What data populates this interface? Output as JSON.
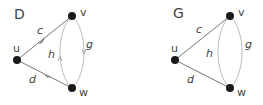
{
  "colors": {
    "node": "#1a1a1a",
    "straight_edge": "#777777",
    "curved_edge": "#bbbbbb",
    "text": "#444444"
  },
  "graphs": [
    {
      "name": "D",
      "directed": true,
      "title": "D",
      "nodes": [
        {
          "id": "u",
          "label": "u"
        },
        {
          "id": "v",
          "label": "v"
        },
        {
          "id": "w",
          "label": "w"
        }
      ],
      "edges": [
        {
          "label": "c",
          "from": "u",
          "to": "v"
        },
        {
          "label": "d",
          "from": "w",
          "to": "u"
        },
        {
          "label": "g",
          "from": "v",
          "to": "w"
        },
        {
          "label": "h",
          "from": "w",
          "to": "v"
        }
      ]
    },
    {
      "name": "G",
      "directed": false,
      "title": "G",
      "nodes": [
        {
          "id": "u",
          "label": "u"
        },
        {
          "id": "v",
          "label": "v"
        },
        {
          "id": "w",
          "label": "w"
        }
      ],
      "edges": [
        {
          "label": "c",
          "ends": [
            "u",
            "v"
          ]
        },
        {
          "label": "d",
          "ends": [
            "u",
            "w"
          ]
        },
        {
          "label": "g",
          "ends": [
            "v",
            "w"
          ]
        },
        {
          "label": "h",
          "ends": [
            "v",
            "w"
          ]
        }
      ]
    }
  ]
}
